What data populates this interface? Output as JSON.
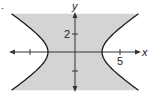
{
  "figure": {
    "marker": ".",
    "colors": {
      "shade": "#d4d4d4",
      "curve": "#1a1a1a",
      "axis": "#333333",
      "background": "#ffffff"
    }
  },
  "axes": {
    "x_label": "x",
    "y_label": "y",
    "x_tick_labels": [
      {
        "value": -5,
        "label": ""
      },
      {
        "value": 5,
        "label": "5"
      }
    ],
    "y_tick_labels": [
      {
        "value": 2,
        "label": "2"
      },
      {
        "value": -2,
        "label": ""
      }
    ]
  },
  "chart_data": {
    "type": "diagram",
    "title": "",
    "relation": "x^2/9 - y^2/4 < 1",
    "curve": "hyperbola x^2/9 - y^2/4 = 1",
    "vertices": [
      [
        -3,
        0
      ],
      [
        3,
        0
      ]
    ],
    "shaded_region": "between the branches (contains origin)",
    "xlabel": "x",
    "ylabel": "y",
    "x_ticks": [
      -5,
      5
    ],
    "x_tick_labels": [
      "",
      "5"
    ],
    "y_ticks": [
      2,
      -2
    ],
    "y_tick_labels": [
      "2",
      ""
    ],
    "xlim": [
      -7.2,
      7.2
    ],
    "ylim": [
      -4.3,
      4.3
    ],
    "grid": false
  }
}
